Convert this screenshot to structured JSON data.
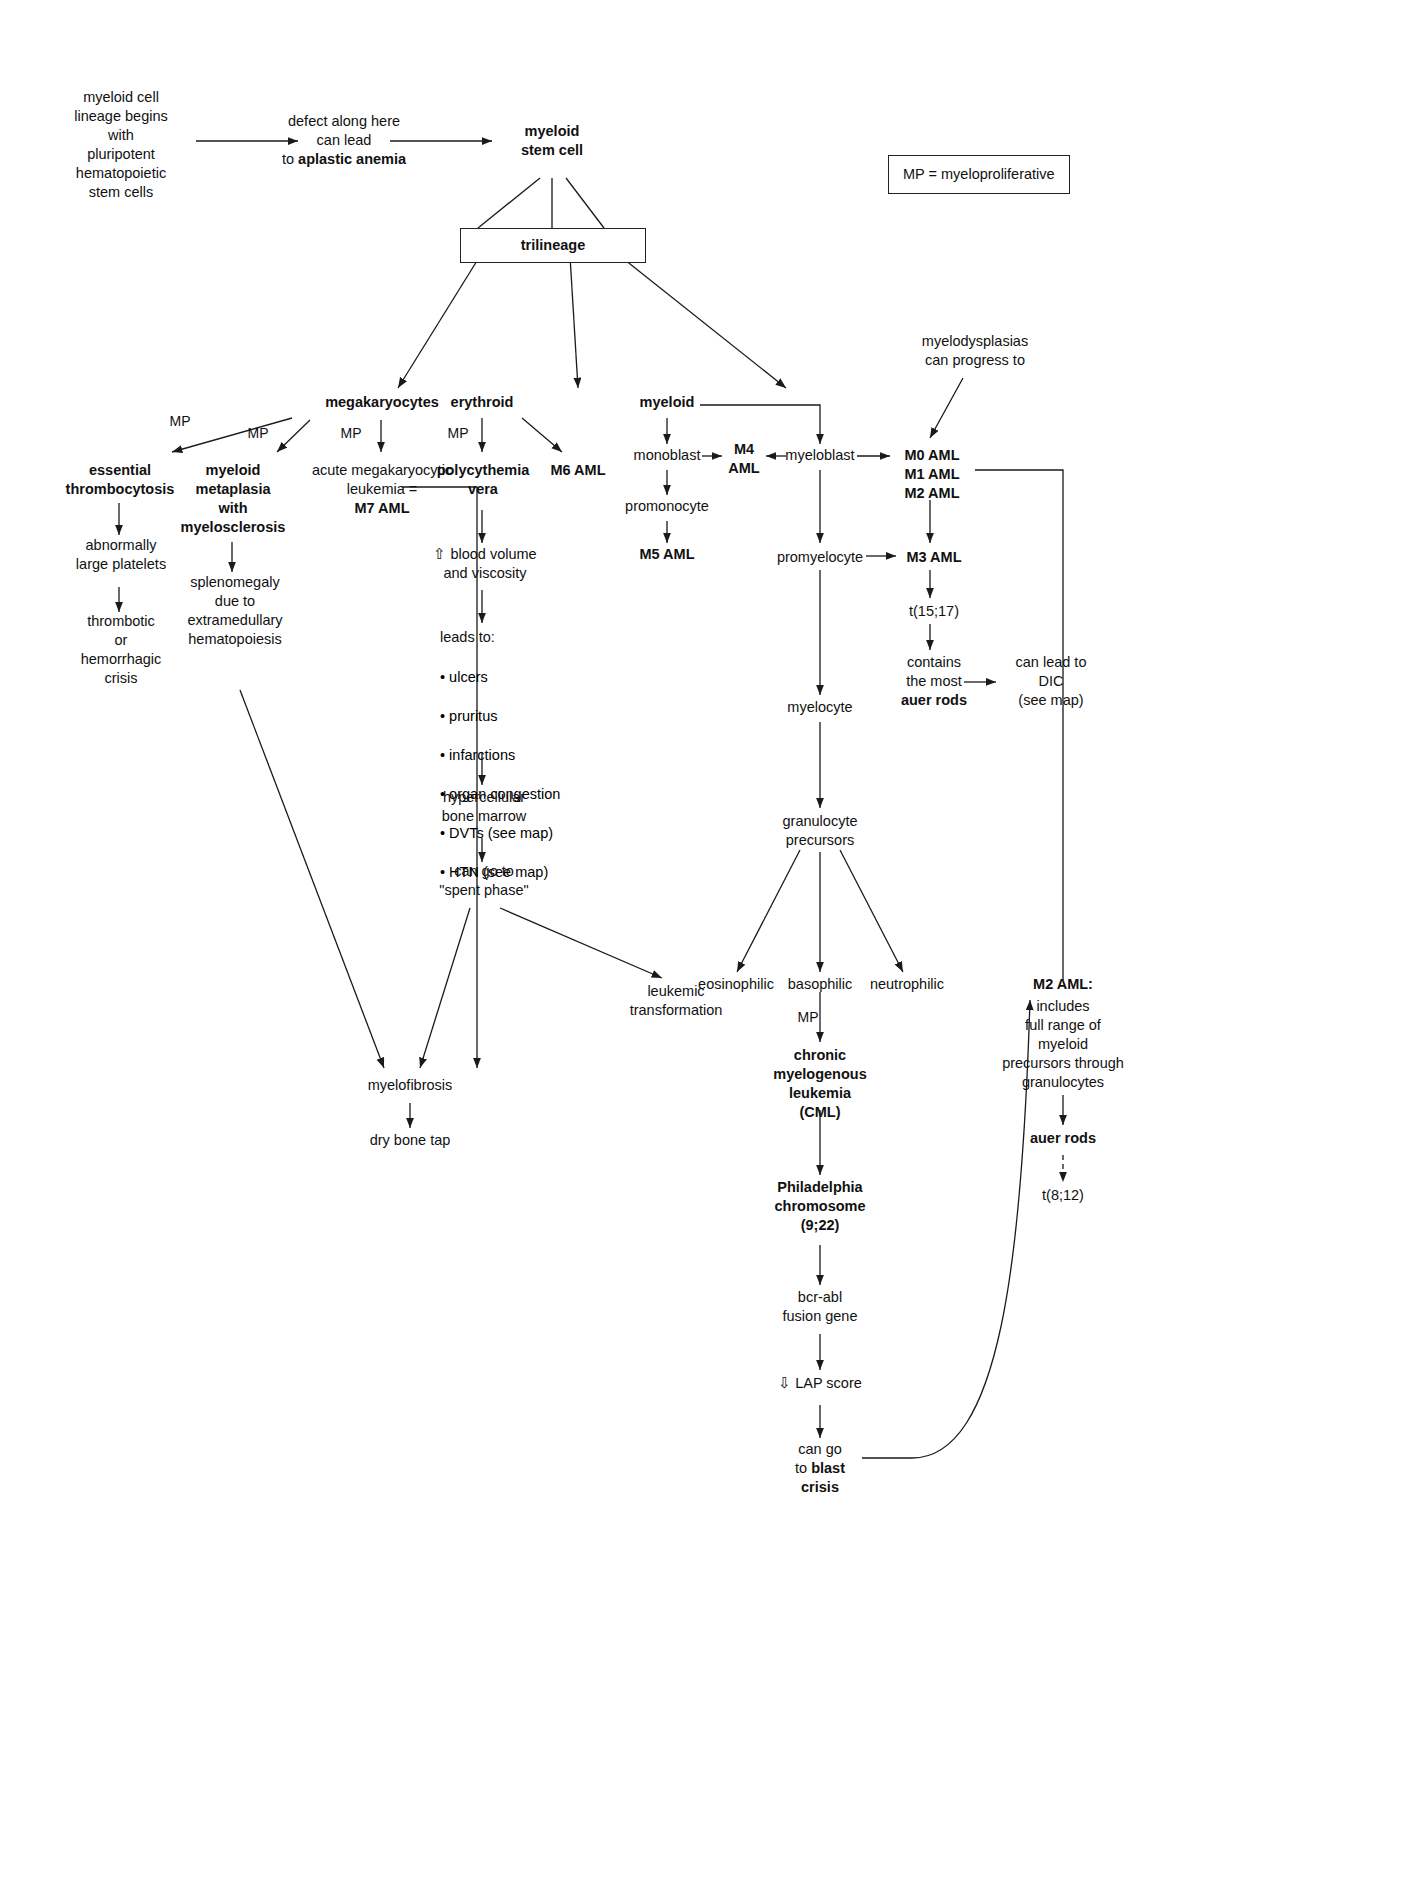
{
  "diagram": {
    "legend": {
      "text": "MP = myeloproliferative"
    },
    "edge_labels": {
      "mp": "MP",
      "mp2": "MP",
      "mp3": "MP",
      "mp_erythroid": "MP",
      "mp_basophilic": "MP"
    },
    "nodes": {
      "origin": "myeloid cell\nlineage begins\nwith\npluripotent\nhematopoietic\nstem cells",
      "defect_plain": "defect along here\ncan lead\nto ",
      "defect_bold": "aplastic anemia",
      "myeloid_stem_cell": "myeloid\nstem cell",
      "trilineage": "trilineage",
      "megakaryocytes": "megakaryocytes",
      "erythroid": "erythroid",
      "myeloid": "myeloid",
      "essential_thrombocytosis": "essential\nthrombocytosis",
      "abnormally_large_platelets": "abnormally\nlarge platelets",
      "thrombotic_crisis": "thrombotic\nor\nhemorrhagic\ncrisis",
      "myeloid_metaplasia": "myeloid\nmetaplasia\nwith\nmyelosclerosis",
      "splenomegaly": "splenomegaly\ndue to\nextramedullary\nhematopoiesis",
      "acute_mega_plain": "acute megakaryocytic\nleukemia =",
      "acute_mega_bold": "M7 AML",
      "polycythemia_vera": "polycythemia\nvera",
      "m6_aml": "M6 AML",
      "blood_volume": "⇧ blood volume\nand viscosity",
      "leads_to_header": "leads to:",
      "leads_to_items": [
        "• ulcers",
        "• pruritus",
        "• infarctions",
        "• organ congestion",
        "• DVTs (see map)",
        "• HTN (see map)"
      ],
      "hypercellular": "hypercellular\nbone marrow",
      "spent_phase": "can go to\n\"spent phase\"",
      "leukemic_transformation": "leukemic\ntransformation",
      "myelofibrosis": "myelofibrosis",
      "dry_bone_tap": "dry bone tap",
      "monoblast": "monoblast",
      "m4_aml": "M4\nAML",
      "myeloblast": "myeloblast",
      "promonocyte": "promonocyte",
      "m5_aml": "M5 AML",
      "promyelocyte": "promyelocyte",
      "m3_aml": "M3 AML",
      "t1517": "t(15;17)",
      "auer_rods_most": "contains\nthe most\nauer rods",
      "auer_rods_most_plain": "contains\nthe most",
      "auer_rods_most_bold": "auer rods",
      "dic": "can lead to\nDIC\n(see map)",
      "myelocyte": "myelocyte",
      "granulocyte_precursors": "granulocyte\nprecursors",
      "eosinophilic": "eosinophilic",
      "basophilic": "basophilic",
      "neutrophilic": "neutrophilic",
      "cml": "chronic\nmyelogenous\nleukemia\n(CML)",
      "philadelphia": "Philadelphia\nchromosome\n(9;22)",
      "bcr_abl": "bcr-abl\nfusion gene",
      "lap_score": "⇩ LAP score",
      "blast_crisis_plain_1": "can go",
      "blast_crisis_plain_2": "to ",
      "blast_crisis_bold": "blast",
      "blast_crisis_plain_3": "crisis",
      "myelodysplasias": "myelodysplasias\ncan progress to",
      "m0_aml": "M0 AML",
      "m1_aml": "M1 AML",
      "m2_aml": "M2 AML",
      "m2_aml_title": "M2 AML:",
      "m2_aml_detail": "includes\nfull range of\nmyeloid\nprecursors through\ngranulocytes",
      "auer_rods": "auer rods",
      "t812": "t(8;12)"
    }
  }
}
